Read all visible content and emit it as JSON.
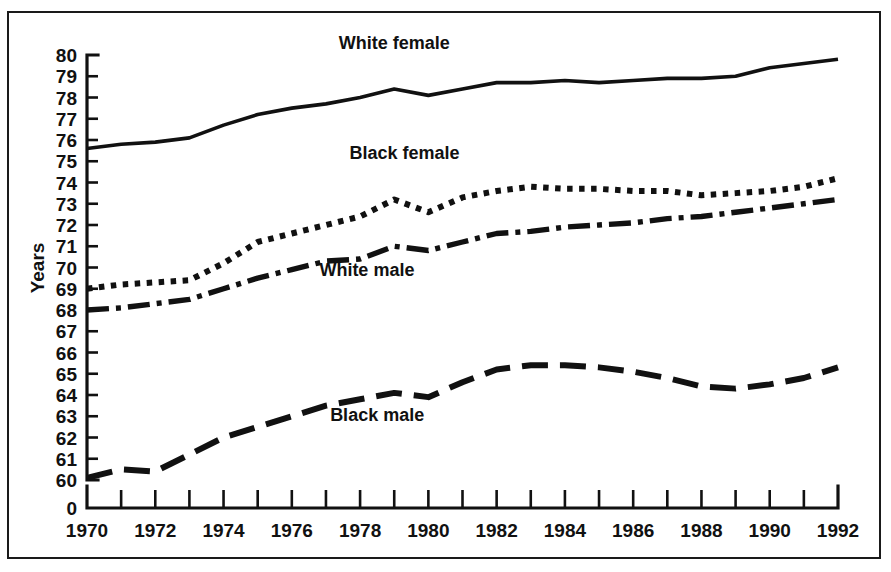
{
  "figure": {
    "axis_title_y": "Years",
    "break_label": "0"
  },
  "chart_data": {
    "type": "line",
    "title": "",
    "subtitle": "",
    "xlabel": "",
    "ylabel": "Years",
    "xlim": [
      1970,
      1992
    ],
    "ylim": [
      60,
      80
    ],
    "grid": false,
    "legend_position": "inline-annotations",
    "axis_break": {
      "present": true,
      "below_value": 60,
      "zero_label": "0"
    },
    "x": [
      1970,
      1971,
      1972,
      1973,
      1974,
      1975,
      1976,
      1977,
      1978,
      1979,
      1980,
      1981,
      1982,
      1983,
      1984,
      1985,
      1986,
      1987,
      1988,
      1989,
      1990,
      1991,
      1992
    ],
    "x_tick_labels": [
      "1970",
      "1972",
      "1974",
      "1976",
      "1978",
      "1980",
      "1982",
      "1984",
      "1986",
      "1988",
      "1990",
      "1992"
    ],
    "y_tick_labels": [
      "80",
      "79",
      "78",
      "77",
      "76",
      "75",
      "74",
      "73",
      "72",
      "71",
      "70",
      "69",
      "68",
      "67",
      "66",
      "65",
      "64",
      "63",
      "62",
      "61",
      "60"
    ],
    "series": [
      {
        "name": "White female",
        "style": "solid",
        "label_x": 1979.0,
        "label_y": 80.3,
        "values": [
          75.6,
          75.8,
          75.9,
          76.1,
          76.7,
          77.2,
          77.5,
          77.7,
          78.0,
          78.4,
          78.1,
          78.4,
          78.7,
          78.7,
          78.8,
          78.7,
          78.8,
          78.9,
          78.9,
          79.0,
          79.4,
          79.6,
          79.8
        ]
      },
      {
        "name": "Black female",
        "style": "dotted",
        "label_x": 1979.3,
        "label_y": 75.1,
        "values": [
          69.0,
          69.2,
          69.3,
          69.4,
          70.2,
          71.2,
          71.6,
          72.0,
          72.4,
          73.2,
          72.6,
          73.3,
          73.6,
          73.8,
          73.7,
          73.7,
          73.6,
          73.6,
          73.4,
          73.5,
          73.6,
          73.8,
          74.2
        ]
      },
      {
        "name": "White male",
        "style": "dash-dot",
        "label_x": 1978.2,
        "label_y": 69.6,
        "values": [
          68.0,
          68.1,
          68.3,
          68.5,
          69.0,
          69.5,
          69.9,
          70.3,
          70.4,
          71.0,
          70.8,
          71.2,
          71.6,
          71.7,
          71.9,
          72.0,
          72.1,
          72.3,
          72.4,
          72.6,
          72.8,
          73.0,
          73.2
        ]
      },
      {
        "name": "Black male",
        "style": "dashed",
        "label_x": 1978.5,
        "label_y": 62.8,
        "values": [
          60.1,
          60.5,
          60.4,
          61.2,
          62.0,
          62.5,
          63.0,
          63.5,
          63.8,
          64.1,
          63.9,
          64.6,
          65.2,
          65.4,
          65.4,
          65.3,
          65.1,
          64.8,
          64.4,
          64.3,
          64.5,
          64.8,
          65.3
        ]
      }
    ]
  }
}
